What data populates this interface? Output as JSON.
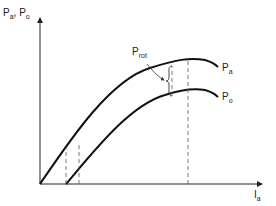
{
  "diagram": {
    "y_axis_label": {
      "main1": "P",
      "sub1": "a",
      "sep": ", ",
      "main2": "P",
      "sub2": "o"
    },
    "x_axis_label": {
      "main": "I",
      "sub": "a"
    },
    "curves": [
      {
        "name": "upper",
        "label_main": "P",
        "label_sub": "a"
      },
      {
        "name": "lower",
        "label_main": "P",
        "label_sub": "o"
      }
    ],
    "annotation": {
      "main": "P",
      "sub": "rot"
    },
    "colors": {
      "line": "#222222",
      "dashed": "#555555"
    }
  }
}
